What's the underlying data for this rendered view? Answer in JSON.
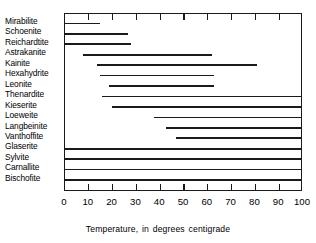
{
  "chart_data": {
    "type": "bar",
    "orientation": "horizontal",
    "title": "",
    "xlabel": "Temperature, in degrees centigrade",
    "ylabel": "",
    "xlim": [
      0,
      100
    ],
    "xticks": [
      0,
      10,
      20,
      30,
      40,
      50,
      60,
      70,
      80,
      90,
      100
    ],
    "xtick_labels": [
      "0",
      "10",
      "20",
      "30",
      "40",
      "50",
      "60",
      "70",
      "80",
      "90",
      "100"
    ],
    "grid": false,
    "legend": null,
    "categories": [
      "Mirabilite",
      "Schoenite",
      "Reichardtite",
      "Astrakanite",
      "Kainite",
      "Hexahydrite",
      "Leonite",
      "Thenardite",
      "Kieserite",
      "Loeweite",
      "Langbeinite",
      "Vanthoffite",
      "Glaserite",
      "Sylvite",
      "Carnallite",
      "Bischofite"
    ],
    "bars": [
      {
        "category": "Mirabilite",
        "start": 0,
        "end": 15
      },
      {
        "category": "Schoenite",
        "start": 0,
        "end": 27
      },
      {
        "category": "Reichardtite",
        "start": 0,
        "end": 28
      },
      {
        "category": "Astrakanite",
        "start": 8,
        "end": 62
      },
      {
        "category": "Kainite",
        "start": 14,
        "end": 81
      },
      {
        "category": "Hexahydrite",
        "start": 15,
        "end": 63
      },
      {
        "category": "Leonite",
        "start": 19,
        "end": 63
      },
      {
        "category": "Thenardite",
        "start": 16,
        "end": 100
      },
      {
        "category": "Kieserite",
        "start": 20,
        "end": 100
      },
      {
        "category": "Loeweite",
        "start": 38,
        "end": 100
      },
      {
        "category": "Langbeinite",
        "start": 43,
        "end": 100
      },
      {
        "category": "Vanthoffite",
        "start": 47,
        "end": 100
      },
      {
        "category": "Glaserite",
        "start": 0,
        "end": 100
      },
      {
        "category": "Sylvite",
        "start": 0,
        "end": 100
      },
      {
        "category": "Carnallite",
        "start": 0,
        "end": 100
      },
      {
        "category": "Bischofite",
        "start": 0,
        "end": 100
      }
    ],
    "colors": {
      "bar": "#1a1a1a",
      "axis": "#1a1a1a",
      "background": "#ffffff",
      "text": "#000000"
    }
  }
}
